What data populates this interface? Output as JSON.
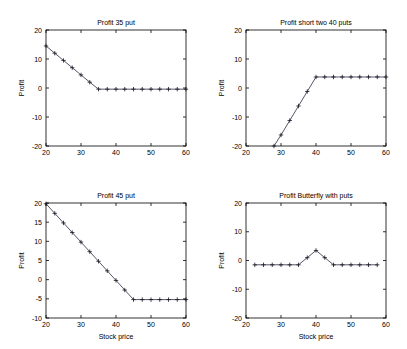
{
  "figure": {
    "width": 407,
    "height": 349,
    "background": "#ffffff",
    "line_color": "#2b2b44",
    "axis_color": "#000000",
    "marker": "plus"
  },
  "chart_data": [
    {
      "type": "line",
      "panel": "top-left",
      "title": "Profit 35 put",
      "xlabel": "",
      "ylabel": "Profit",
      "xlim": [
        20,
        60
      ],
      "ylim": [
        -20,
        20
      ],
      "xticks": [
        20,
        30,
        40,
        50,
        60
      ],
      "yticks": [
        -20,
        -10,
        0,
        10,
        20
      ],
      "xticklabels": [
        "20",
        "30",
        "40",
        "50",
        "60"
      ],
      "yticklabels": [
        "-20",
        "-10",
        "0",
        "10",
        "20"
      ],
      "grid": false,
      "legend": "none",
      "x": [
        20,
        22.5,
        25,
        27.5,
        30,
        32.5,
        35,
        37.5,
        40,
        42.5,
        45,
        47.5,
        50,
        52.5,
        55,
        57.5,
        60
      ],
      "y": [
        14.5,
        12.0,
        9.5,
        7.0,
        4.5,
        2.0,
        -0.4,
        -0.4,
        -0.4,
        -0.4,
        -0.4,
        -0.4,
        -0.4,
        -0.4,
        -0.4,
        -0.4,
        -0.4
      ]
    },
    {
      "type": "line",
      "panel": "top-right",
      "title": "Profit short two 40 puts",
      "xlabel": "",
      "ylabel": "Profit",
      "xlim": [
        20,
        60
      ],
      "ylim": [
        -20,
        20
      ],
      "xticks": [
        20,
        30,
        40,
        50,
        60
      ],
      "yticks": [
        -20,
        -10,
        0,
        10,
        20
      ],
      "xticklabels": [
        "20",
        "30",
        "40",
        "50",
        "60"
      ],
      "yticklabels": [
        "-20",
        "-10",
        "0",
        "10",
        "20"
      ],
      "grid": false,
      "legend": "none",
      "x": [
        28,
        30,
        32.5,
        35,
        37.5,
        40,
        42.5,
        45,
        47.5,
        50,
        52.5,
        55,
        57.5,
        60
      ],
      "y": [
        -20,
        -16.2,
        -11.2,
        -6.2,
        -1.2,
        3.8,
        3.8,
        3.8,
        3.8,
        3.8,
        3.8,
        3.8,
        3.8,
        3.8
      ]
    },
    {
      "type": "line",
      "panel": "bottom-left",
      "title": "Profit 45 put",
      "xlabel": "Stock price",
      "ylabel": "Profit",
      "xlim": [
        20,
        60
      ],
      "ylim": [
        -10,
        20
      ],
      "xticks": [
        20,
        30,
        40,
        50,
        60
      ],
      "yticks": [
        -10,
        -5,
        0,
        5,
        10,
        15,
        20
      ],
      "xticklabels": [
        "20",
        "30",
        "40",
        "50",
        "60"
      ],
      "yticklabels": [
        "-10",
        "-5",
        "0",
        "5",
        "10",
        "15",
        "20"
      ],
      "grid": false,
      "legend": "none",
      "x": [
        20,
        22.5,
        25,
        27.5,
        30,
        32.5,
        35,
        37.5,
        40,
        42.5,
        45,
        47.5,
        50,
        52.5,
        55,
        57.5,
        60
      ],
      "y": [
        19.8,
        17.3,
        14.8,
        12.3,
        9.8,
        7.3,
        4.8,
        2.3,
        -0.2,
        -2.7,
        -5.2,
        -5.2,
        -5.2,
        -5.2,
        -5.2,
        -5.2,
        -5.2
      ]
    },
    {
      "type": "line",
      "panel": "bottom-right",
      "title": "Profit Butterfly with puts",
      "xlabel": "Stock price",
      "ylabel": "Profit",
      "xlim": [
        20,
        60
      ],
      "ylim": [
        -20,
        20
      ],
      "xticks": [
        20,
        30,
        40,
        50,
        60
      ],
      "yticks": [
        -20,
        -10,
        0,
        10,
        20
      ],
      "xticklabels": [
        "20",
        "30",
        "40",
        "50",
        "60"
      ],
      "yticklabels": [
        "-20",
        "-10",
        "0",
        "10",
        "20"
      ],
      "grid": false,
      "legend": "none",
      "x": [
        22.5,
        25,
        27.5,
        30,
        32.5,
        35,
        37.5,
        40,
        42.5,
        45,
        47.5,
        50,
        52.5,
        55,
        57.5
      ],
      "y": [
        -1.5,
        -1.5,
        -1.5,
        -1.5,
        -1.5,
        -1.5,
        1.0,
        3.5,
        1.0,
        -1.5,
        -1.5,
        -1.5,
        -1.5,
        -1.5,
        -1.5
      ]
    }
  ]
}
